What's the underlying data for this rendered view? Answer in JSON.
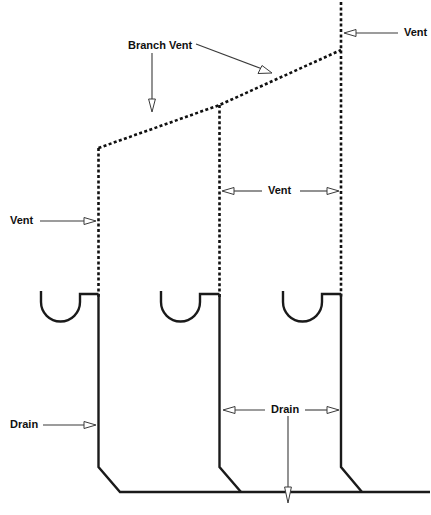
{
  "diagram": {
    "title": "Plumbing Vent and Drain Diagram",
    "type": "plumbing-riser-diagram",
    "colors": {
      "background": "#ffffff",
      "pipe_solid": "#1a1a1a",
      "pipe_dashed": "#101010",
      "arrow": "#3a3a3a",
      "text": "#101010"
    },
    "labels": {
      "branch_vent": "Branch Vent",
      "vent_top_right": "Vent",
      "vent_middle": "Vent",
      "vent_left": "Vent",
      "drain_left": "Drain",
      "drain_middle": "Drain"
    },
    "legend_note": "Dashed lines represent vent piping; solid lines represent drain piping.",
    "fixtures": {
      "count": 3,
      "kind": "p-trap-fixture"
    },
    "stacks": {
      "count": 3,
      "kind": "vertical-stack"
    }
  }
}
